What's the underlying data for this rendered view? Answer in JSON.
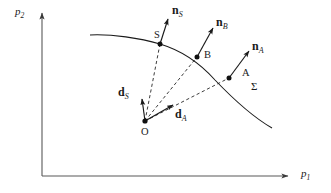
{
  "figure": {
    "type": "vector-diagram",
    "background_color": "#ffffff",
    "stroke_color": "#1a1a1a"
  },
  "axes": {
    "x_label": "p",
    "x_sub": "1",
    "y_label": "p",
    "y_sub": "2",
    "origin_x": 42,
    "origin_y": 176,
    "x_tip": 288,
    "y_tip": 13
  },
  "curve": {
    "name": "Sigma",
    "label": "Σ",
    "points": [
      [
        90,
        35
      ],
      [
        125,
        37
      ],
      [
        160,
        44
      ],
      [
        197,
        57
      ],
      [
        229,
        78
      ],
      [
        252,
        100
      ],
      [
        272,
        128
      ]
    ]
  },
  "points": [
    {
      "id": "S",
      "label": "S",
      "x": 160,
      "y": 44
    },
    {
      "id": "B",
      "label": "B",
      "x": 197,
      "y": 57
    },
    {
      "id": "A",
      "label": "A",
      "x": 229,
      "y": 78
    },
    {
      "id": "O",
      "label": "O",
      "x": 145,
      "y": 121
    }
  ],
  "normals": [
    {
      "id": "nS",
      "label": "n",
      "sub": "S",
      "from": [
        160,
        44
      ],
      "to": [
        168,
        19
      ]
    },
    {
      "id": "nB",
      "label": "n",
      "sub": "B",
      "from": [
        197,
        57
      ],
      "to": [
        213,
        28
      ]
    },
    {
      "id": "nA",
      "label": "n",
      "sub": "A",
      "from": [
        229,
        78
      ],
      "to": [
        249,
        51
      ]
    }
  ],
  "position_vectors": [
    {
      "id": "dS",
      "label": "d",
      "sub": "S",
      "from": [
        145,
        121
      ],
      "to": [
        142,
        99
      ]
    },
    {
      "id": "dA",
      "label": "d",
      "sub": "A",
      "from": [
        145,
        121
      ],
      "to": [
        173,
        105
      ]
    }
  ],
  "dashed_rays": [
    {
      "id": "O-S",
      "from": [
        145,
        121
      ],
      "to": [
        160,
        44
      ]
    },
    {
      "id": "O-B",
      "from": [
        145,
        121
      ],
      "to": [
        197,
        57
      ]
    },
    {
      "id": "O-A",
      "from": [
        145,
        121
      ],
      "to": [
        229,
        78
      ]
    }
  ],
  "labels": {
    "nS": {
      "text": "n",
      "sub": "S",
      "x": 172,
      "y": 4
    },
    "nB": {
      "text": "n",
      "sub": "B",
      "x": 216,
      "y": 16
    },
    "nA": {
      "text": "n",
      "sub": "A",
      "x": 252,
      "y": 40
    },
    "dS": {
      "text": "d",
      "sub": "S",
      "x": 118,
      "y": 86
    },
    "dA": {
      "text": "d",
      "sub": "A",
      "x": 175,
      "y": 108
    },
    "S": {
      "text": "S",
      "x": 154,
      "y": 30
    },
    "B": {
      "text": "B",
      "x": 204,
      "y": 50
    },
    "A": {
      "text": "A",
      "x": 242,
      "y": 68
    },
    "O": {
      "text": "O",
      "x": 141,
      "y": 127
    },
    "Sigma": {
      "text": "Σ",
      "x": 251,
      "y": 81
    },
    "p1": {
      "text": "p",
      "sub": "1",
      "x": 301,
      "y": 168
    },
    "p2": {
      "text": "p",
      "sub": "2",
      "x": 15,
      "y": 6
    }
  }
}
